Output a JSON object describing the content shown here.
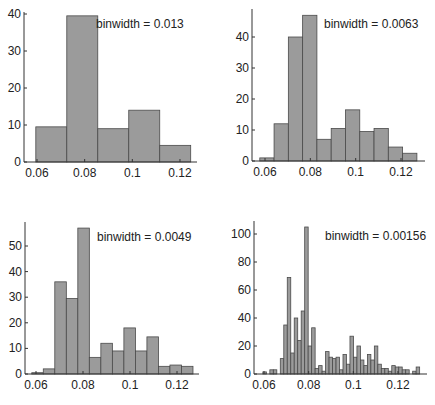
{
  "chart_data": [
    {
      "type": "bar",
      "title": "",
      "annotation": "binwidth = 0.013",
      "xlabel": "",
      "ylabel": "",
      "bin_start": 0.0595,
      "binwidth": 0.013,
      "values": [
        9.5,
        39.5,
        9,
        14,
        4.5
      ],
      "xticks": [
        "0.06",
        "0.08",
        "0.1",
        "0.12"
      ],
      "xtick_values": [
        0.06,
        0.08,
        0.1,
        0.12
      ],
      "yticks": [
        "0",
        "10",
        "20",
        "30",
        "40"
      ],
      "ytick_values": [
        0,
        10,
        20,
        30,
        40
      ],
      "ylim": [
        0,
        40.5
      ],
      "grid": false,
      "layout": {
        "axis_x": 24,
        "baseline_y": 162,
        "top_y": 12,
        "right_x": 197,
        "ppu_y": 3.7,
        "x0_px": 37,
        "x0_val": 0.06,
        "ppu_x": 2383,
        "annot_x": 96,
        "annot_y": 28
      }
    },
    {
      "type": "bar",
      "title": "",
      "annotation": "binwidth = 0.0063",
      "xlabel": "",
      "ylabel": "",
      "bin_start": 0.0577,
      "binwidth": 0.0063,
      "values": [
        1,
        12,
        40,
        47,
        7,
        10.5,
        16.5,
        9.5,
        10.5,
        4.5,
        2.5
      ],
      "xticks": [
        "0.06",
        "0.08",
        "0.1",
        "0.12"
      ],
      "xtick_values": [
        0.06,
        0.08,
        0.1,
        0.12
      ],
      "yticks": [
        "0",
        "10",
        "20",
        "30",
        "40"
      ],
      "ytick_values": [
        0,
        10,
        20,
        30,
        40
      ],
      "ylim": [
        0,
        49
      ],
      "grid": false,
      "layout": {
        "axis_x": 252,
        "baseline_y": 161,
        "top_y": 9,
        "right_x": 425,
        "ppu_y": 3.1,
        "x0_px": 265,
        "x0_val": 0.06,
        "ppu_x": 2267,
        "annot_x": 324,
        "annot_y": 28
      }
    },
    {
      "type": "bar",
      "title": "",
      "annotation": "binwidth = 0.0049",
      "xlabel": "",
      "ylabel": "",
      "bin_start": 0.0582,
      "binwidth": 0.0049,
      "values": [
        0.5,
        2,
        36,
        29.5,
        57,
        6.5,
        12,
        9,
        18,
        9,
        14.5,
        3,
        3.5,
        3
      ],
      "xticks": [
        "0.06",
        "0.08",
        "0.1",
        "0.12"
      ],
      "xtick_values": [
        0.06,
        0.08,
        0.1,
        0.12
      ],
      "yticks": [
        "0",
        "10",
        "20",
        "30",
        "40",
        "50"
      ],
      "ytick_values": [
        0,
        10,
        20,
        30,
        40,
        50
      ],
      "ylim": [
        0,
        59
      ],
      "grid": false,
      "layout": {
        "axis_x": 25,
        "baseline_y": 374,
        "top_y": 222,
        "right_x": 199,
        "ppu_y": 2.56,
        "x0_px": 36,
        "x0_val": 0.06,
        "ppu_x": 2350,
        "annot_x": 97,
        "annot_y": 241
      }
    },
    {
      "type": "bar",
      "title": "",
      "annotation": "binwidth = 0.00156",
      "xlabel": "",
      "ylabel": "",
      "bin_start": 0.0595,
      "binwidth": 0.00156,
      "values": [
        1.5,
        0,
        3,
        3,
        0,
        11,
        35,
        69,
        15,
        40,
        24,
        45,
        105,
        20,
        33,
        4,
        6,
        2,
        16,
        12,
        11,
        12,
        3,
        14,
        7,
        27,
        12,
        20,
        10,
        6,
        14,
        10,
        20,
        7,
        4,
        4,
        2,
        6,
        5,
        5,
        3,
        3,
        0,
        2,
        5
      ],
      "xticks": [
        "0.06",
        "0.08",
        "0.1",
        "0.12"
      ],
      "xtick_values": [
        0.06,
        0.08,
        0.1,
        0.12
      ],
      "yticks": [
        "0",
        "20",
        "40",
        "60",
        "80",
        "100"
      ],
      "ytick_values": [
        0,
        20,
        40,
        60,
        80,
        100
      ],
      "ylim": [
        0,
        110
      ],
      "grid": false,
      "layout": {
        "axis_x": 254,
        "baseline_y": 374,
        "top_y": 221,
        "right_x": 427,
        "ppu_y": 1.4,
        "x0_px": 264,
        "x0_val": 0.06,
        "ppu_x": 2233,
        "annot_x": 325,
        "annot_y": 240
      }
    }
  ],
  "style": {
    "bar_fill": "#9b9b9b",
    "bar_edge": "#4a4a4a",
    "axis_color": "#333333",
    "text_color": "#222222"
  }
}
